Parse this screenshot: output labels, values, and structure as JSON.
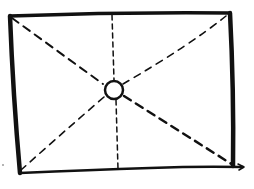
{
  "diagram": {
    "type": "hand-drawn sketch",
    "colors": {
      "ink": "#111111",
      "background": "#ffffff"
    },
    "frame": {
      "top_left": [
        10,
        16
      ],
      "top_right": [
        230,
        13
      ],
      "bottom_right": [
        233,
        166
      ],
      "bottom_left": [
        20,
        173
      ]
    },
    "center_marker": {
      "shape": "circle",
      "center": [
        114,
        90
      ],
      "radius": 9
    },
    "guides": [
      {
        "name": "diagonal-tl-br",
        "style": "dashed"
      },
      {
        "name": "diagonal-tr-bl",
        "style": "dashed"
      },
      {
        "name": "vertical-center",
        "style": "dashed"
      }
    ]
  }
}
